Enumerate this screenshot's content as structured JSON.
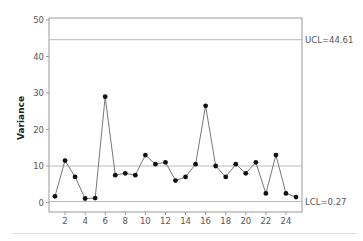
{
  "chart_data": {
    "type": "line",
    "title": "",
    "xlabel": "",
    "ylabel": "Variance",
    "x": [
      1,
      2,
      3,
      4,
      5,
      6,
      7,
      8,
      9,
      10,
      11,
      12,
      13,
      14,
      15,
      16,
      17,
      18,
      19,
      20,
      21,
      22,
      23,
      24,
      25
    ],
    "values": [
      1.7,
      11.5,
      7.0,
      1.1,
      1.2,
      29.0,
      7.5,
      8.0,
      7.5,
      13.0,
      10.5,
      11.0,
      6.0,
      7.0,
      10.5,
      26.5,
      10.0,
      7.0,
      10.5,
      8.0,
      11.0,
      2.5,
      13.0,
      2.5,
      1.5
    ],
    "xticks": [
      2,
      4,
      6,
      8,
      10,
      12,
      14,
      16,
      18,
      20,
      22,
      24
    ],
    "yticks": [
      0,
      10,
      20,
      30,
      40,
      50
    ],
    "xlim": [
      0.3,
      25.7
    ],
    "ylim": [
      -2,
      50.5
    ],
    "grid": false,
    "legend": null,
    "control_lines": {
      "ucl": {
        "value": 44.61,
        "label": "UCL=44.61"
      },
      "center": {
        "value": 10.0,
        "label": ""
      },
      "lcl": {
        "value": 0.27,
        "label": "LCL=0.27"
      }
    },
    "colors": {
      "line": "#777777",
      "marker": "#111111",
      "control_line": "#bbbbbb",
      "frame": "#999999"
    }
  }
}
